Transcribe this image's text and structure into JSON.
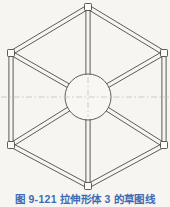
{
  "figure": {
    "caption": "图 9-121  拉伸形体 3 的草图线"
  },
  "drawing": {
    "background": "#f6f5f1",
    "line_color": "#4a4a48",
    "node_fill": "#fbfaf7",
    "circle_fill": "#f8f7f3",
    "centerline_color": "#c2c1b8",
    "caption_color": "#3f6bb4",
    "width": 170,
    "height": 192,
    "center": {
      "x": 88,
      "y": 97
    },
    "circle_radius": 23,
    "tube_half_width": 2.1,
    "node_size": 7,
    "hex_vertices": [
      {
        "x": 88,
        "y": 7
      },
      {
        "x": 164,
        "y": 53
      },
      {
        "x": 164,
        "y": 145
      },
      {
        "x": 88,
        "y": 186
      },
      {
        "x": 11,
        "y": 145
      },
      {
        "x": 11,
        "y": 53
      }
    ],
    "centerline": {
      "y": 97,
      "x1": 1,
      "x2": 169
    },
    "crosshair_half": 20
  }
}
